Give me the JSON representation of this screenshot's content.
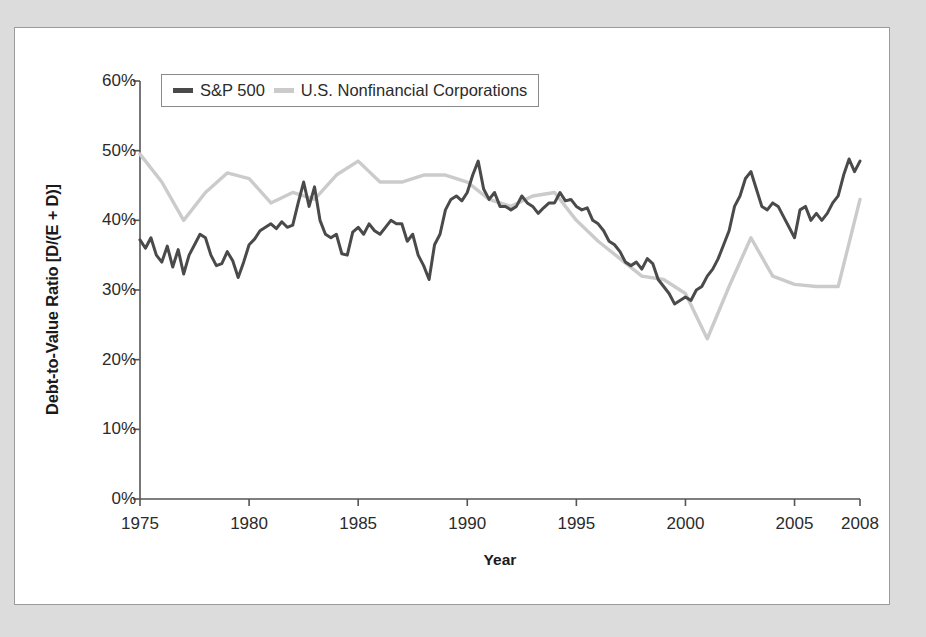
{
  "chart_data": {
    "type": "line",
    "title": "",
    "xlabel": "Year",
    "ylabel": "Debt-to-Value Ratio [D/(E + D)]",
    "xlim": [
      1975,
      2008
    ],
    "ylim": [
      0,
      60
    ],
    "yticks": [
      "0%",
      "10%",
      "20%",
      "30%",
      "40%",
      "50%",
      "60%"
    ],
    "ytick_values": [
      0,
      10,
      20,
      30,
      40,
      50,
      60
    ],
    "xticks": [
      "1975",
      "1980",
      "1985",
      "1990",
      "1995",
      "2000",
      "2005",
      "2008"
    ],
    "xtick_values": [
      1975,
      1980,
      1985,
      1990,
      1995,
      2000,
      2005,
      2008
    ],
    "grid": false,
    "legend_position": "upper-left-inside",
    "units": "percent",
    "series": [
      {
        "name": "S&P 500",
        "color": "#4a4a4a",
        "x": [
          1975.0,
          1975.25,
          1975.5,
          1975.75,
          1976.0,
          1976.25,
          1976.5,
          1976.75,
          1977.0,
          1977.25,
          1977.5,
          1977.75,
          1978.0,
          1978.25,
          1978.5,
          1978.75,
          1979.0,
          1979.25,
          1979.5,
          1979.75,
          1980.0,
          1980.25,
          1980.5,
          1980.75,
          1981.0,
          1981.25,
          1981.5,
          1981.75,
          1982.0,
          1982.25,
          1982.5,
          1982.75,
          1983.0,
          1983.25,
          1983.5,
          1983.75,
          1984.0,
          1984.25,
          1984.5,
          1984.75,
          1985.0,
          1985.25,
          1985.5,
          1985.75,
          1986.0,
          1986.25,
          1986.5,
          1986.75,
          1987.0,
          1987.25,
          1987.5,
          1987.75,
          1988.0,
          1988.25,
          1988.5,
          1988.75,
          1989.0,
          1989.25,
          1989.5,
          1989.75,
          1990.0,
          1990.25,
          1990.5,
          1990.75,
          1991.0,
          1991.25,
          1991.5,
          1991.75,
          1992.0,
          1992.25,
          1992.5,
          1992.75,
          1993.0,
          1993.25,
          1993.5,
          1993.75,
          1994.0,
          1994.25,
          1994.5,
          1994.75,
          1995.0,
          1995.25,
          1995.5,
          1995.75,
          1996.0,
          1996.25,
          1996.5,
          1996.75,
          1997.0,
          1997.25,
          1997.5,
          1997.75,
          1998.0,
          1998.25,
          1998.5,
          1998.75,
          1999.0,
          1999.25,
          1999.5,
          1999.75,
          2000.0,
          2000.25,
          2000.5,
          2000.75,
          2001.0,
          2001.25,
          2001.5,
          2001.75,
          2002.0,
          2002.25,
          2002.5,
          2002.75,
          2003.0,
          2003.25,
          2003.5,
          2003.75,
          2004.0,
          2004.25,
          2004.5,
          2004.75,
          2005.0,
          2005.25,
          2005.5,
          2005.75,
          2006.0,
          2006.25,
          2006.5,
          2006.75,
          2007.0,
          2007.25,
          2007.5,
          2007.75,
          2008.0
        ],
        "values": [
          37.2,
          36.0,
          37.5,
          35.0,
          34.0,
          36.3,
          33.3,
          35.8,
          32.3,
          35.0,
          36.5,
          38.0,
          37.5,
          35.0,
          33.5,
          33.8,
          35.5,
          34.2,
          31.8,
          34.0,
          36.5,
          37.3,
          38.5,
          39.0,
          39.5,
          38.8,
          39.8,
          39.0,
          39.3,
          42.5,
          45.5,
          42.0,
          44.8,
          40.0,
          38.0,
          37.5,
          38.0,
          35.2,
          35.0,
          38.3,
          39.0,
          38.0,
          39.5,
          38.5,
          38.0,
          39.0,
          40.0,
          39.5,
          39.5,
          37.0,
          38.0,
          35.0,
          33.5,
          31.5,
          36.5,
          38.0,
          41.5,
          43.0,
          43.5,
          42.8,
          44.0,
          46.5,
          48.5,
          44.5,
          43.0,
          44.0,
          42.0,
          42.0,
          41.5,
          42.0,
          43.5,
          42.5,
          42.0,
          41.0,
          41.8,
          42.5,
          42.5,
          44.0,
          42.8,
          43.0,
          42.0,
          41.5,
          41.8,
          40.0,
          39.5,
          38.5,
          37.0,
          36.5,
          35.5,
          34.0,
          33.5,
          34.0,
          33.0,
          34.5,
          33.8,
          31.5,
          30.5,
          29.5,
          28.0,
          28.5,
          29.0,
          28.5,
          30.0,
          30.5,
          32.0,
          33.0,
          34.5,
          36.5,
          38.5,
          42.0,
          43.5,
          46.0,
          47.0,
          44.5,
          42.0,
          41.5,
          42.5,
          42.0,
          40.5,
          39.0,
          37.5,
          41.5,
          42.0,
          40.0,
          41.0,
          40.0,
          41.0,
          42.5,
          43.5,
          46.5,
          48.8,
          47.0,
          48.5
        ]
      },
      {
        "name": "U.S. Nonfinancial Corporations",
        "color": "#cbcbcb",
        "x": [
          1975,
          1976,
          1977,
          1978,
          1979,
          1980,
          1981,
          1982,
          1983,
          1984,
          1985,
          1986,
          1987,
          1988,
          1989,
          1990,
          1991,
          1992,
          1993,
          1994,
          1995,
          1996,
          1997,
          1998,
          1999,
          2000,
          2001,
          2002,
          2003,
          2004,
          2005,
          2006,
          2007,
          2008
        ],
        "values": [
          49.5,
          45.5,
          40.0,
          44.0,
          46.8,
          46.0,
          42.5,
          44.0,
          43.0,
          46.5,
          48.5,
          45.5,
          45.5,
          46.5,
          46.5,
          45.5,
          43.0,
          42.0,
          43.5,
          44.0,
          40.0,
          37.0,
          34.5,
          32.0,
          31.5,
          29.5,
          23.0,
          30.5,
          37.5,
          32.0,
          30.8,
          30.5,
          30.5,
          43.0
        ]
      }
    ]
  },
  "legend": {
    "entries": [
      {
        "label": "S&P 500",
        "color": "#4a4a4a"
      },
      {
        "label": "U.S. Nonfinancial Corporations",
        "color": "#cbcbcb"
      }
    ]
  },
  "axes": {
    "x_title": "Year",
    "y_title": "Debt-to-Value Ratio [D/(E + D)]"
  }
}
